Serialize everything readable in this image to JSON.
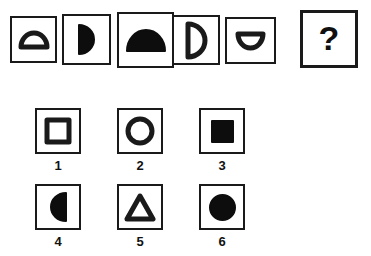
{
  "puzzle": {
    "type": "figure-series-matrix",
    "prompt_row": {
      "name": "sequence-row",
      "cells": [
        {
          "index": 1,
          "shape": "half-circle",
          "fill": "outline",
          "flat_side": "bottom",
          "size": "small",
          "box": {
            "x": 10,
            "y": 16,
            "w": 47,
            "h": 47
          },
          "shape_w": 26,
          "shape_h": 14
        },
        {
          "index": 2,
          "shape": "half-circle",
          "fill": "solid",
          "flat_side": "left",
          "size": "medium",
          "box": {
            "x": 62,
            "y": 14,
            "w": 49,
            "h": 51
          },
          "shape_w": 15,
          "shape_h": 29
        },
        {
          "index": 3,
          "shape": "half-circle",
          "fill": "solid",
          "flat_side": "bottom",
          "size": "large",
          "box": {
            "x": 117,
            "y": 12,
            "w": 57,
            "h": 56
          },
          "shape_w": 38,
          "shape_h": 21
        },
        {
          "index": 4,
          "shape": "half-circle",
          "fill": "outline",
          "flat_side": "left",
          "size": "medium",
          "box": {
            "x": 172,
            "y": 15,
            "w": 48,
            "h": 50
          },
          "shape_w": 17,
          "shape_h": 33
        },
        {
          "index": 5,
          "shape": "half-circle",
          "fill": "outline",
          "flat_side": "top",
          "size": "small",
          "box": {
            "x": 225,
            "y": 17,
            "w": 51,
            "h": 47
          },
          "shape_w": 25,
          "shape_h": 14
        }
      ]
    },
    "answer_cell": {
      "name": "answer-placeholder",
      "label": "?",
      "box": {
        "x": 300,
        "y": 10,
        "w": 58,
        "h": 58
      }
    },
    "options": [
      {
        "label": "1",
        "shape": "square",
        "fill": "outline",
        "box": {
          "x": 35,
          "y": 108,
          "w": 46,
          "h": 46
        },
        "shape_w": 22,
        "shape_h": 22,
        "label_y": 158
      },
      {
        "label": "2",
        "shape": "circle",
        "fill": "outline",
        "box": {
          "x": 117,
          "y": 108,
          "w": 46,
          "h": 46
        },
        "shape_w": 24,
        "shape_h": 24,
        "label_y": 158
      },
      {
        "label": "3",
        "shape": "square",
        "fill": "solid",
        "box": {
          "x": 199,
          "y": 108,
          "w": 46,
          "h": 46
        },
        "shape_w": 21,
        "shape_h": 21,
        "label_y": 158
      },
      {
        "label": "4",
        "shape": "half-circle",
        "fill": "solid",
        "flat_side": "right",
        "box": {
          "x": 35,
          "y": 184,
          "w": 46,
          "h": 46
        },
        "shape_w": 15,
        "shape_h": 28,
        "label_y": 234
      },
      {
        "label": "5",
        "shape": "triangle",
        "fill": "outline",
        "box": {
          "x": 117,
          "y": 184,
          "w": 46,
          "h": 46
        },
        "shape_w": 26,
        "shape_h": 23,
        "label_y": 234
      },
      {
        "label": "6",
        "shape": "circle",
        "fill": "solid",
        "box": {
          "x": 199,
          "y": 184,
          "w": 46,
          "h": 46
        },
        "shape_w": 25,
        "shape_h": 25,
        "label_y": 234
      }
    ]
  },
  "colors": {
    "ink": "#1a1a1a",
    "fill_solid": "#0d0d0d",
    "paper": "#ffffff"
  }
}
